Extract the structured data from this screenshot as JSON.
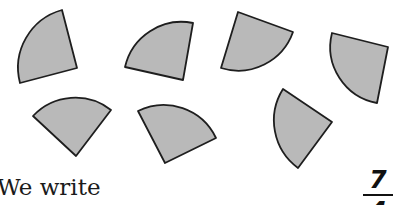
{
  "figure": {
    "shape": "quarter-circle sector",
    "fill_color": "#b9b9b9",
    "stroke_color": "#1e1e1e",
    "wedge_count": 7,
    "wedges": [
      {
        "id": 1,
        "apex": [
          77,
          68
        ],
        "arc_start": [
          62,
          10
        ],
        "arc_end": [
          20,
          83
        ]
      },
      {
        "id": 2,
        "apex": [
          183,
          80
        ],
        "arc_start": [
          193,
          23
        ],
        "arc_end": [
          125,
          67
        ]
      },
      {
        "id": 3,
        "apex": [
          238,
          12
        ],
        "arc_start": [
          293,
          32
        ],
        "arc_end": [
          221,
          68
        ]
      },
      {
        "id": 4,
        "apex": [
          388,
          47
        ],
        "arc_start": [
          332,
          33
        ],
        "arc_end": [
          377,
          103
        ]
      },
      {
        "id": 5,
        "apex": [
          76,
          156
        ],
        "arc_start": [
          33,
          116
        ],
        "arc_end": [
          111,
          110
        ]
      },
      {
        "id": 6,
        "apex": [
          165,
          163
        ],
        "arc_start": [
          138,
          111
        ],
        "arc_end": [
          216,
          138
        ]
      },
      {
        "id": 7,
        "apex": [
          332,
          122
        ],
        "arc_start": [
          283,
          89
        ],
        "arc_end": [
          298,
          168
        ]
      }
    ]
  },
  "text": {
    "sentence_start": "We write"
  },
  "fraction": {
    "numerator": "7",
    "denominator": "4"
  }
}
